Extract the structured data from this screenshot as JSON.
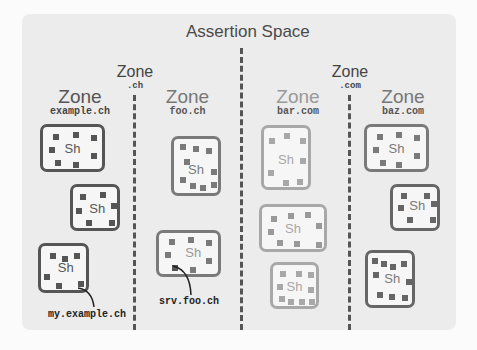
{
  "title": "Assertion Space",
  "colors": {
    "dark": "#555555",
    "mid": "#7a7a7a",
    "light": "#a8a8a8"
  },
  "zones": [
    {
      "word": "Zone",
      "name": ".ch"
    },
    {
      "word": "Zone",
      "name": "example.ch"
    },
    {
      "word": "Zone",
      "name": "foo.ch"
    },
    {
      "word": "Zone",
      "name": ".com"
    },
    {
      "word": "Zone",
      "name": "bar.com"
    },
    {
      "word": "Zone",
      "name": "baz.com"
    }
  ],
  "shard_label": "Sh",
  "callouts": [
    {
      "text": "my.example.ch"
    },
    {
      "text": "srv.foo.ch"
    }
  ]
}
